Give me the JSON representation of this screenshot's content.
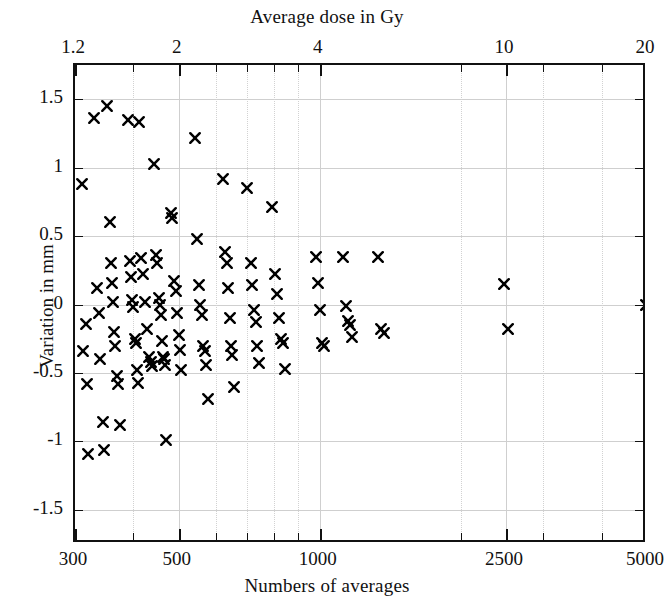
{
  "chart_data": {
    "type": "scatter",
    "title": "",
    "xlabel": "Numbers of averages",
    "ylabel": "Variation in mm",
    "top_axis_label": "Average dose in Gy",
    "xscale": "log",
    "yscale": "linear",
    "xlim": [
      300,
      5000
    ],
    "ylim": [
      -1.75,
      1.75
    ],
    "grid": true,
    "legend": null,
    "marker": "x",
    "marker_color": "#000000",
    "xticks": [
      300,
      500,
      1000,
      2500,
      5000
    ],
    "xtick_labels": [
      "300",
      "500",
      "1000",
      "2500",
      "5000"
    ],
    "top_xticks": [
      1.2,
      2,
      4,
      10,
      20
    ],
    "top_xtick_labels": [
      "1.2",
      "2",
      "4",
      "10",
      "20"
    ],
    "yticks": [
      1.5,
      1,
      0.5,
      0,
      -0.5,
      -1,
      -1.5
    ],
    "ytick_labels": [
      "1.5",
      "1",
      "0.5",
      "0",
      "-0.5",
      "-1",
      "-1.5"
    ],
    "points": [
      [
        310,
        0.88
      ],
      [
        312,
        -0.34
      ],
      [
        316,
        -0.14
      ],
      [
        318,
        -0.58
      ],
      [
        320,
        -1.09
      ],
      [
        330,
        1.36
      ],
      [
        335,
        0.12
      ],
      [
        338,
        -0.06
      ],
      [
        340,
        -0.4
      ],
      [
        344,
        -0.86
      ],
      [
        346,
        -1.06
      ],
      [
        352,
        1.45
      ],
      [
        356,
        0.6
      ],
      [
        358,
        0.3
      ],
      [
        360,
        0.16
      ],
      [
        362,
        0.02
      ],
      [
        364,
        -0.2
      ],
      [
        366,
        -0.3
      ],
      [
        368,
        -0.52
      ],
      [
        370,
        -0.58
      ],
      [
        374,
        -0.88
      ],
      [
        390,
        1.35
      ],
      [
        394,
        0.32
      ],
      [
        396,
        0.2
      ],
      [
        398,
        0.03
      ],
      [
        400,
        -0.02
      ],
      [
        402,
        -0.25
      ],
      [
        404,
        -0.28
      ],
      [
        406,
        -0.48
      ],
      [
        408,
        -0.57
      ],
      [
        412,
        1.33
      ],
      [
        416,
        0.34
      ],
      [
        420,
        0.22
      ],
      [
        424,
        0.02
      ],
      [
        428,
        -0.18
      ],
      [
        432,
        -0.38
      ],
      [
        436,
        -0.42
      ],
      [
        438,
        -0.45
      ],
      [
        442,
        1.03
      ],
      [
        446,
        0.36
      ],
      [
        450,
        0.3
      ],
      [
        454,
        0.05
      ],
      [
        456,
        0.0
      ],
      [
        458,
        -0.08
      ],
      [
        460,
        -0.27
      ],
      [
        462,
        -0.38
      ],
      [
        464,
        -0.4
      ],
      [
        466,
        -0.44
      ],
      [
        470,
        -0.99
      ],
      [
        480,
        0.67
      ],
      [
        484,
        0.63
      ],
      [
        488,
        0.17
      ],
      [
        492,
        0.1
      ],
      [
        496,
        -0.06
      ],
      [
        500,
        -0.22
      ],
      [
        502,
        -0.33
      ],
      [
        506,
        -0.48
      ],
      [
        540,
        1.22
      ],
      [
        546,
        0.48
      ],
      [
        552,
        0.14
      ],
      [
        556,
        0.0
      ],
      [
        560,
        -0.08
      ],
      [
        564,
        -0.3
      ],
      [
        568,
        -0.34
      ],
      [
        572,
        -0.44
      ],
      [
        576,
        -0.69
      ],
      [
        620,
        0.92
      ],
      [
        628,
        0.38
      ],
      [
        634,
        0.3
      ],
      [
        638,
        0.12
      ],
      [
        642,
        -0.1
      ],
      [
        646,
        -0.3
      ],
      [
        650,
        -0.37
      ],
      [
        656,
        -0.6
      ],
      [
        700,
        0.85
      ],
      [
        712,
        0.3
      ],
      [
        718,
        0.14
      ],
      [
        724,
        -0.04
      ],
      [
        730,
        -0.13
      ],
      [
        736,
        -0.3
      ],
      [
        742,
        -0.43
      ],
      [
        790,
        0.71
      ],
      [
        804,
        0.22
      ],
      [
        812,
        0.08
      ],
      [
        820,
        -0.1
      ],
      [
        828,
        -0.25
      ],
      [
        836,
        -0.28
      ],
      [
        844,
        -0.47
      ],
      [
        980,
        0.35
      ],
      [
        990,
        0.16
      ],
      [
        1000,
        -0.04
      ],
      [
        1010,
        -0.28
      ],
      [
        1020,
        -0.3
      ],
      [
        1120,
        0.35
      ],
      [
        1140,
        -0.01
      ],
      [
        1150,
        -0.12
      ],
      [
        1160,
        -0.15
      ],
      [
        1170,
        -0.24
      ],
      [
        1330,
        0.35
      ],
      [
        1350,
        -0.18
      ],
      [
        1370,
        -0.21
      ],
      [
        2480,
        0.15
      ],
      [
        2520,
        -0.18
      ],
      [
        4980,
        0.0
      ]
    ]
  },
  "icons": {
    "marker_name": "x-marker-icon"
  }
}
